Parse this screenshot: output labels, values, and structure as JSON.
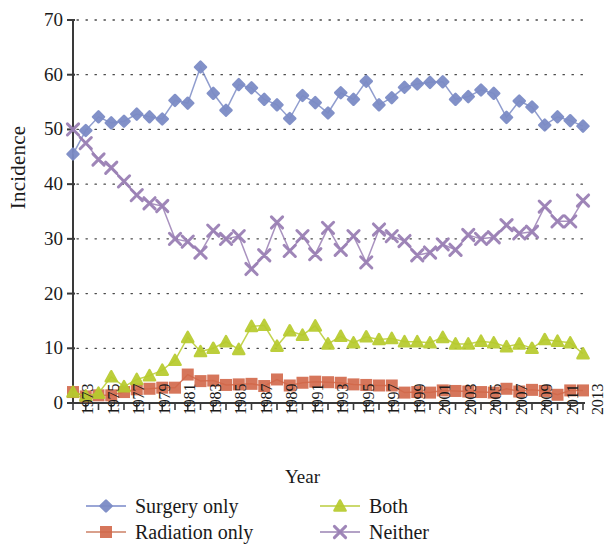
{
  "chart_data": {
    "type": "line",
    "title": "",
    "xlabel": "Year",
    "ylabel": "Incidence",
    "xlim": [
      1973,
      2013
    ],
    "ylim": [
      0,
      70
    ],
    "yticks": [
      0,
      10,
      20,
      30,
      40,
      50,
      60,
      70
    ],
    "grid": "horizontal-dotted",
    "legend_position": "bottom",
    "x": [
      1973,
      1974,
      1975,
      1976,
      1977,
      1978,
      1979,
      1980,
      1981,
      1982,
      1983,
      1984,
      1985,
      1986,
      1987,
      1988,
      1989,
      1990,
      1991,
      1992,
      1993,
      1994,
      1995,
      1996,
      1997,
      1998,
      1999,
      2000,
      2001,
      2002,
      2003,
      2004,
      2005,
      2006,
      2007,
      2008,
      2009,
      2010,
      2011,
      2012,
      2013
    ],
    "xtick_labels": [
      "1973",
      "1975",
      "1977",
      "1979",
      "1981",
      "1983",
      "1985",
      "1987",
      "1989",
      "1991",
      "1993",
      "1995",
      "1997",
      "1999",
      "2001",
      "2003",
      "2005",
      "2007",
      "2009",
      "2011",
      "2013"
    ],
    "series": [
      {
        "name": "Surgery only",
        "color": "#7c8cc6",
        "marker": "diamond",
        "values": [
          45.5,
          49.8,
          52.3,
          51.2,
          51.5,
          52.8,
          52.3,
          51.9,
          55.3,
          54.8,
          61.4,
          56.6,
          53.5,
          58.2,
          57.6,
          55.5,
          54.5,
          52.0,
          56.2,
          54.9,
          53.0,
          56.7,
          55.5,
          58.8,
          54.5,
          55.8,
          57.7,
          58.3,
          58.6,
          58.7,
          55.5,
          56.0,
          57.2,
          56.6,
          52.2,
          55.2,
          54.1,
          50.8,
          52.3,
          51.6,
          50.6
        ]
      },
      {
        "name": "Radiation only",
        "color": "#d2684a",
        "marker": "square",
        "values": [
          2.0,
          1.2,
          1.4,
          1.4,
          2.0,
          2.5,
          2.6,
          2.8,
          2.8,
          5.2,
          4.0,
          4.1,
          3.3,
          3.4,
          3.5,
          3.1,
          4.3,
          3.2,
          3.7,
          3.9,
          3.8,
          3.7,
          3.4,
          3.3,
          3.2,
          3.2,
          1.9,
          2.0,
          1.9,
          2.3,
          2.2,
          2.1,
          2.0,
          1.9,
          2.6,
          2.1,
          2.4,
          2.2,
          1.5,
          2.3,
          2.3
        ]
      },
      {
        "name": "Both",
        "color": "#b7cb2e",
        "marker": "triangle",
        "values": [
          2.0,
          1.3,
          1.8,
          4.8,
          3.0,
          4.3,
          5.0,
          6.0,
          7.8,
          12.0,
          9.4,
          10.0,
          11.2,
          9.8,
          14.0,
          14.2,
          10.4,
          13.2,
          12.4,
          14.1,
          10.8,
          12.2,
          11.0,
          12.1,
          11.6,
          11.8,
          11.2,
          11.2,
          11.0,
          12.0,
          10.8,
          10.8,
          11.3,
          11.0,
          10.3,
          10.8,
          10.0,
          11.6,
          11.3,
          11.0,
          9.0
        ]
      },
      {
        "name": "Neither",
        "color": "#9a7fb4",
        "marker": "cross",
        "values": [
          50.0,
          47.5,
          44.5,
          43.0,
          40.5,
          38.0,
          36.5,
          36.0,
          30.0,
          29.5,
          27.5,
          31.5,
          30.0,
          30.5,
          24.5,
          27.0,
          33.0,
          27.8,
          30.5,
          27.2,
          32.0,
          28.0,
          30.5,
          25.7,
          31.7,
          30.5,
          29.6,
          27.0,
          27.5,
          29.0,
          28.0,
          30.7,
          30.0,
          30.3,
          32.5,
          31.0,
          31.3,
          35.9,
          33.2,
          33.2,
          37.0
        ]
      }
    ]
  },
  "axes": {
    "y_title": "Incidence",
    "x_title": "Year"
  }
}
